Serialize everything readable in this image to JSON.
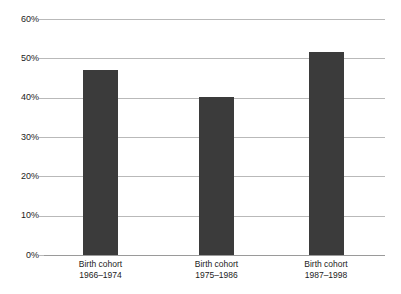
{
  "chart_data": {
    "type": "bar",
    "title": "",
    "subtitle": "",
    "xlabel": "",
    "ylabel": "",
    "categories": [
      "Birth cohort 1966–1974",
      "Birth cohort 1975–1986",
      "Birth cohort 1987–1998"
    ],
    "category_lines": [
      [
        "Birth cohort",
        "1966–1974"
      ],
      [
        "Birth cohort",
        "1975–1986"
      ],
      [
        "Birth cohort",
        "1987–1998"
      ]
    ],
    "values": [
      47.0,
      40.3,
      51.5
    ],
    "value_labels": [
      "",
      "",
      ""
    ],
    "ylim": [
      0,
      60
    ],
    "ytick_values": [
      0,
      10,
      20,
      30,
      40,
      50,
      60
    ],
    "ytick_labels": [
      "0%",
      "10%",
      "20%",
      "30%",
      "40%",
      "50%",
      "60%"
    ],
    "grid": true,
    "legend": false,
    "legend_position": "none",
    "bar_color": "#3b3b3b",
    "gridline_color": "#b9b9b9",
    "axis_color": "#9a9a9a",
    "background_color": "#ffffff",
    "text_color": "#1c1c1c"
  }
}
